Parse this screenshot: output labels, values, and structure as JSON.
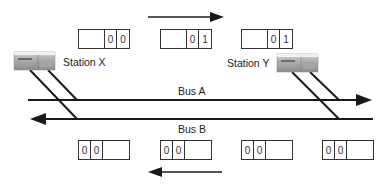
{
  "diagram": {
    "stations": [
      {
        "id": "x",
        "label": "Station X"
      },
      {
        "id": "y",
        "label": "Station Y"
      }
    ],
    "buses": [
      {
        "id": "a",
        "label": "Bus A",
        "direction": "right"
      },
      {
        "id": "b",
        "label": "Bus B",
        "direction": "left"
      }
    ],
    "top_slots": [
      {
        "bits": [
          "0",
          "0"
        ],
        "bit_position": "right"
      },
      {
        "bits": [
          "0",
          "1"
        ],
        "bit_position": "right"
      },
      {
        "bits": [
          "0",
          "1"
        ],
        "bit_position": "right"
      }
    ],
    "bottom_slots": [
      {
        "bits": [
          "0",
          "0"
        ],
        "bit_position": "left"
      },
      {
        "bits": [
          "0",
          "0"
        ],
        "bit_position": "left"
      },
      {
        "bits": [
          "0",
          "0"
        ],
        "bit_position": "left"
      },
      {
        "bits": [
          "0",
          "0"
        ],
        "bit_position": "left"
      }
    ],
    "flow_arrows": [
      {
        "position": "top",
        "direction": "right"
      },
      {
        "position": "bottom",
        "direction": "left"
      }
    ],
    "colors": {
      "line": "#1a1a1a",
      "station_body": "#9a9a9a"
    }
  }
}
